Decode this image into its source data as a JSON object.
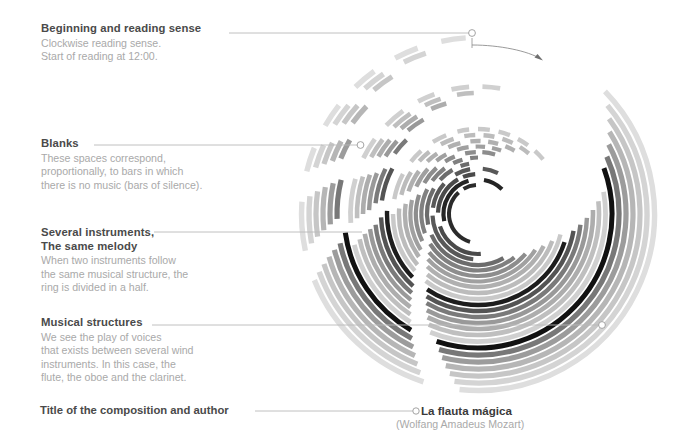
{
  "page": {
    "background": "#ffffff",
    "width": 684,
    "height": 437
  },
  "callouts": [
    {
      "id": "beginning",
      "title": "Beginning and reading sense",
      "lines": [
        "Clockwise reading sense.",
        "Start of reading at 12:00."
      ],
      "x": 41,
      "y": 22,
      "leader": {
        "x1": 229,
        "y1": 33,
        "x2": 470,
        "y2": 33
      },
      "dot": {
        "cx": 472,
        "cy": 33,
        "r": 3.4
      },
      "arrow": true
    },
    {
      "id": "blanks",
      "title": "Blanks",
      "lines": [
        "These spaces correspond,",
        "proportionally, to bars in which",
        "there is no music (bars of silence)."
      ],
      "x": 41,
      "y": 137,
      "leader": {
        "x1": 94,
        "y1": 145,
        "x2": 358,
        "y2": 145
      },
      "dot": {
        "cx": 360.5,
        "cy": 145,
        "r": 3.4
      },
      "arrow": false
    },
    {
      "id": "several-instruments",
      "title": "Several instruments,",
      "title2": "The same melody",
      "lines": [
        "When two instruments follow",
        "the same musical structure, the",
        "ring is divided in a half."
      ],
      "x": 41,
      "y": 226,
      "leader": {
        "x1": 154,
        "y1": 232,
        "x2": 362,
        "y2": 232
      },
      "dot": null,
      "arrow": false
    },
    {
      "id": "musical-structures",
      "title": "Musical structures",
      "lines": [
        "We see the play of voices",
        "that exists between several wind",
        "instruments. In this case, the",
        "flute, the oboe and the clarinet."
      ],
      "x": 41,
      "y": 316,
      "leader": {
        "x1": 152,
        "y1": 325,
        "x2": 600,
        "y2": 325
      },
      "dot": {
        "cx": 602,
        "cy": 325,
        "r": 3.4
      },
      "arrow": false
    }
  ],
  "footer": {
    "label": "Title of the composition and author",
    "leader": {
      "x1": 255,
      "y1": 411,
      "x2": 414,
      "y2": 411
    },
    "dot": {
      "cx": 416,
      "cy": 411,
      "r": 3.2
    },
    "composition": "La flauta mágica",
    "author": "(Wolfang Amadeus Mozart)"
  },
  "colors": {
    "ink_darkest": "#1a1a1a",
    "ink_dark": "#3f3f3f",
    "ink_mid": "#6e6e6e",
    "ink_grey": "#919191",
    "ink_light": "#b4b4b4",
    "ink_lighter": "#cfcfcf",
    "ink_faint": "#e2e2e2",
    "text_title": "#4a4a4a",
    "text_body": "#a9a9a9",
    "leader_line": "#b9b9b9"
  },
  "chart_data": {
    "type": "radial-bar",
    "title": "La flauta mágica",
    "subtitle": "(Wolfang Amadeus Mozart)",
    "center": {
      "cx": 478,
      "cy": 214
    },
    "inner_radius": 25,
    "outer_radius": 181,
    "start_angle_deg": 0,
    "direction": "clockwise",
    "reading_start": "12:00",
    "gap_meaning": "bars of silence",
    "split_ring_meaning": "two instruments share the same musical structure",
    "instruments": [
      "flute",
      "oboe",
      "clarinet"
    ],
    "rings": [
      {
        "r": 29,
        "w": 4.0,
        "color": "#2b2b2b",
        "segments": [
          [
            196,
            318
          ],
          [
            330,
            356
          ]
        ]
      },
      {
        "r": 34.5,
        "w": 4.2,
        "color": "#242424",
        "segments": [
          [
            258,
            344
          ],
          [
            10,
            44
          ]
        ]
      },
      {
        "r": 40,
        "w": 4.2,
        "color": "#4a4a4a",
        "segments": [
          [
            176,
            252
          ],
          [
            272,
            330
          ],
          [
            338,
            356
          ]
        ]
      },
      {
        "r": 45.5,
        "w": 4.2,
        "color": "#585858",
        "segments": [
          [
            186,
            268
          ],
          [
            278,
            312
          ],
          [
            330,
            350
          ],
          [
            6,
            26
          ]
        ]
      },
      {
        "r": 51,
        "w": 4.2,
        "color": "#6c6c6c",
        "segments": [
          [
            150,
            246
          ],
          [
            258,
            300
          ],
          [
            312,
            330
          ],
          [
            340,
            350
          ]
        ]
      },
      {
        "r": 56.5,
        "w": 4.2,
        "color": "#808080",
        "segments": [
          [
            140,
            238
          ],
          [
            250,
            296
          ],
          [
            306,
            324
          ],
          [
            334,
            344
          ],
          [
            352,
            360
          ]
        ]
      },
      {
        "r": 62,
        "w": 4.2,
        "color": "#8d8d8d",
        "segments": [
          [
            130,
            232
          ],
          [
            244,
            288
          ],
          [
            300,
            318
          ],
          [
            328,
            338
          ],
          [
            348,
            358
          ],
          [
            4,
            16
          ]
        ]
      },
      {
        "r": 67.5,
        "w": 4.2,
        "color": "#a0a0a0",
        "segments": [
          [
            122,
            228
          ],
          [
            238,
            282
          ],
          [
            294,
            312
          ],
          [
            322,
            332
          ],
          [
            342,
            352
          ],
          [
            358,
            6
          ],
          [
            12,
            20
          ]
        ]
      },
      {
        "r": 73,
        "w": 4.4,
        "color": "#b0b0b0",
        "segments": [
          [
            116,
            224
          ],
          [
            234,
            278
          ],
          [
            288,
            306
          ],
          [
            316,
            326
          ],
          [
            336,
            346
          ],
          [
            354,
            2
          ],
          [
            8,
            16
          ],
          [
            22,
            30
          ]
        ]
      },
      {
        "r": 79,
        "w": 4.4,
        "color": "#bcbcbc",
        "segments": [
          [
            110,
            220
          ],
          [
            230,
            274
          ],
          [
            284,
            302
          ],
          [
            312,
            322
          ],
          [
            332,
            342
          ],
          [
            350,
            358
          ],
          [
            4,
            12
          ],
          [
            18,
            26
          ],
          [
            32,
            40
          ]
        ]
      },
      {
        "r": 85,
        "w": 4.4,
        "color": "#c9c9c9",
        "segments": [
          [
            104,
            218
          ],
          [
            228,
            270
          ],
          [
            280,
            298
          ],
          [
            308,
            318
          ],
          [
            328,
            338
          ],
          [
            346,
            354
          ],
          [
            0,
            8
          ],
          [
            14,
            22
          ],
          [
            28,
            36
          ],
          [
            42,
            50
          ]
        ]
      },
      {
        "r": 91,
        "w": 4.4,
        "color": "#1d1d1d",
        "segments": [
          [
            108,
            214
          ],
          [
            226,
            272
          ]
        ]
      },
      {
        "r": 97,
        "w": 4.4,
        "color": "#545454",
        "segments": [
          [
            100,
            212
          ],
          [
            222,
            268
          ],
          [
            278,
            298
          ]
        ]
      },
      {
        "r": 103,
        "w": 4.4,
        "color": "#7a7a7a",
        "segments": [
          [
            96,
            210
          ],
          [
            220,
            264
          ],
          [
            276,
            296
          ],
          [
            306,
            316
          ]
        ]
      },
      {
        "r": 109,
        "w": 4.4,
        "color": "#999999",
        "segments": [
          [
            92,
            208
          ],
          [
            218,
            262
          ],
          [
            272,
            292
          ],
          [
            302,
            312
          ],
          [
            320,
            330
          ]
        ]
      },
      {
        "r": 115,
        "w": 4.6,
        "color": "#adadad",
        "segments": [
          [
            88,
            206
          ],
          [
            216,
            260
          ],
          [
            270,
            290
          ],
          [
            300,
            310
          ],
          [
            318,
            328
          ],
          [
            336,
            344
          ]
        ]
      },
      {
        "r": 121,
        "w": 4.6,
        "color": "#bfbfbf",
        "segments": [
          [
            84,
            204
          ],
          [
            214,
            258
          ],
          [
            268,
            288
          ],
          [
            298,
            308
          ],
          [
            316,
            326
          ],
          [
            334,
            342
          ],
          [
            350,
            358
          ]
        ]
      },
      {
        "r": 127.5,
        "w": 4.8,
        "color": "#d0d0d0",
        "segments": [
          [
            80,
            202
          ],
          [
            212,
            256
          ],
          [
            266,
            286
          ],
          [
            296,
            306
          ],
          [
            314,
            324
          ],
          [
            332,
            340
          ],
          [
            348,
            356
          ],
          [
            2,
            10
          ]
        ]
      },
      {
        "r": 134,
        "w": 5.0,
        "color": "#111111",
        "segments": [
          [
            70,
            198
          ],
          [
            210,
            262
          ]
        ]
      },
      {
        "r": 141,
        "w": 5.2,
        "color": "#787878",
        "segments": [
          [
            66,
            196
          ],
          [
            208,
            258
          ],
          [
            268,
            284
          ]
        ]
      },
      {
        "r": 148,
        "w": 5.2,
        "color": "#9c9c9c",
        "segments": [
          [
            62,
            194
          ],
          [
            206,
            256
          ],
          [
            266,
            282
          ],
          [
            292,
            300
          ]
        ]
      },
      {
        "r": 155,
        "w": 5.2,
        "color": "#b6b6b6",
        "segments": [
          [
            58,
            192
          ],
          [
            204,
            254
          ],
          [
            264,
            280
          ],
          [
            290,
            298
          ],
          [
            306,
            314
          ]
        ]
      },
      {
        "r": 162,
        "w": 5.2,
        "color": "#c6c6c6",
        "segments": [
          [
            54,
            190
          ],
          [
            202,
            252
          ],
          [
            262,
            278
          ],
          [
            288,
            296
          ],
          [
            304,
            312
          ],
          [
            320,
            328
          ]
        ]
      },
      {
        "r": 169,
        "w": 5.4,
        "color": "#d4d4d4",
        "segments": [
          [
            50,
            188
          ],
          [
            200,
            250
          ],
          [
            260,
            276
          ],
          [
            286,
            294
          ],
          [
            302,
            310
          ],
          [
            318,
            326
          ],
          [
            334,
            342
          ]
        ]
      },
      {
        "r": 176.5,
        "w": 5.4,
        "color": "#dedede",
        "segments": [
          [
            46,
            186
          ],
          [
            198,
            248
          ],
          [
            258,
            274
          ],
          [
            284,
            292
          ],
          [
            300,
            308
          ],
          [
            316,
            324
          ],
          [
            332,
            340
          ],
          [
            348,
            356
          ]
        ]
      }
    ]
  }
}
